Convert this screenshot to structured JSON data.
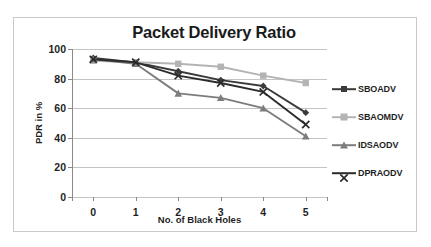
{
  "chart_data": {
    "type": "line",
    "title": "Packet Delivery Ratio",
    "xlabel": "No. of Black Holes",
    "ylabel": "PDR in %",
    "x": [
      0,
      1,
      2,
      3,
      4,
      5
    ],
    "xtick_labels": [
      "0",
      "1",
      "2",
      "3",
      "4",
      "5"
    ],
    "ytick_labels": [
      "0",
      "20",
      "40",
      "60",
      "80",
      "100"
    ],
    "yticks": [
      0,
      20,
      40,
      60,
      80,
      100
    ],
    "ylim": [
      0,
      100
    ],
    "xlim": [
      -0.5,
      5.5
    ],
    "grid": "horizontal",
    "legend_position": "right",
    "series": [
      {
        "name": "SBOADV",
        "values": [
          94,
          91,
          85,
          79,
          75,
          57
        ],
        "color": "#3a3a3a",
        "marker": "diamond"
      },
      {
        "name": "SBAOMDV",
        "values": [
          92,
          91,
          90,
          88,
          82,
          77
        ],
        "color": "#b4b4b4",
        "marker": "square"
      },
      {
        "name": "IDSAODV",
        "values": [
          93,
          90,
          70,
          67,
          60,
          41
        ],
        "color": "#7d7d7d",
        "marker": "triangle"
      },
      {
        "name": "DPRAODV",
        "values": [
          93,
          91,
          82,
          77,
          71,
          49
        ],
        "color": "#2b2b2b",
        "marker": "cross"
      }
    ]
  },
  "colors": {
    "plot_background": "#ffffff",
    "frame_border": "#c9c9c9",
    "gridline": "#c4c4c4",
    "axis": "#8a8a8a",
    "text": "#1f1f1f",
    "title": "#1a1a1a"
  }
}
